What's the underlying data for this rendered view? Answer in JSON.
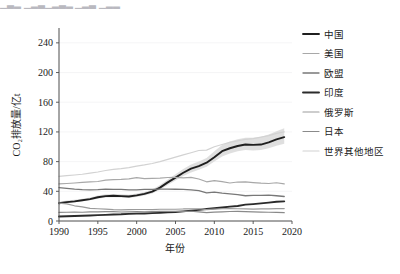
{
  "top_partial_text": "▁▃▂ ▁▂▃▁▂▃▂  ▁▂▃ ▁▂▂",
  "axes": {
    "x_label": "年份",
    "y_label": "CO₂排放量/亿t",
    "x_ticks": [
      "1990",
      "1995",
      "2000",
      "2005",
      "2010",
      "2015",
      "2020"
    ],
    "y_ticks": [
      "0",
      "40",
      "80",
      "120",
      "160",
      "200",
      "240"
    ]
  },
  "legend": {
    "items": [
      {
        "label": "中国",
        "color": "#1f1f1f",
        "width": 1.9
      },
      {
        "label": "美国",
        "color": "#a8a8a8",
        "width": 1.2
      },
      {
        "label": "欧盟",
        "color": "#787878",
        "width": 1.3
      },
      {
        "label": "印度",
        "color": "#2b2b2b",
        "width": 1.9
      },
      {
        "label": "俄罗斯",
        "color": "#9b9b9b",
        "width": 1.2
      },
      {
        "label": "日本",
        "color": "#8a8a8a",
        "width": 1.2
      },
      {
        "label": "世界其他地区",
        "color": "#d2d2d2",
        "width": 1.2
      }
    ]
  },
  "chart_data": {
    "type": "line",
    "title": "",
    "xlabel": "年份",
    "ylabel": "CO₂排放量/亿t",
    "xlim": [
      1990,
      2020
    ],
    "ylim": [
      0,
      260
    ],
    "grid": true,
    "legend_position": "right",
    "x": [
      1990,
      1991,
      1992,
      1993,
      1994,
      1995,
      1996,
      1997,
      1998,
      1999,
      2000,
      2001,
      2002,
      2003,
      2004,
      2005,
      2006,
      2007,
      2008,
      2009,
      2010,
      2011,
      2012,
      2013,
      2014,
      2015,
      2016,
      2017,
      2018,
      2019
    ],
    "series": [
      {
        "name": "中国",
        "color": "#1f1f1f",
        "values": [
          24.0,
          25.5,
          26.5,
          28.0,
          29.5,
          32.0,
          33.5,
          34.0,
          33.5,
          33.0,
          34.5,
          36.5,
          39.5,
          45.0,
          52.0,
          58.5,
          65.0,
          70.5,
          74.0,
          78.5,
          86.0,
          94.0,
          98.0,
          101.0,
          103.0,
          102.5,
          103.0,
          106.0,
          110.0,
          113.0
        ],
        "band_low": [
          22.5,
          24.0,
          25.0,
          26.5,
          28.0,
          30.0,
          31.5,
          32.0,
          31.5,
          31.0,
          32.5,
          34.5,
          37.0,
          42.0,
          48.5,
          54.5,
          60.5,
          65.5,
          69.0,
          73.0,
          80.0,
          87.0,
          91.0,
          94.0,
          95.5,
          95.0,
          95.5,
          98.0,
          101.5,
          104.0
        ],
        "band_high": [
          26.0,
          27.5,
          28.5,
          30.0,
          31.5,
          34.5,
          36.0,
          36.5,
          36.0,
          35.5,
          37.0,
          39.0,
          42.5,
          48.5,
          56.0,
          63.0,
          70.0,
          76.0,
          80.0,
          85.0,
          94.0,
          102.5,
          107.0,
          110.0,
          112.0,
          112.0,
          113.0,
          116.5,
          121.0,
          125.0
        ]
      },
      {
        "name": "美国",
        "color": "#a8a8a8",
        "values": [
          50.0,
          50.5,
          51.2,
          52.0,
          52.7,
          53.2,
          55.0,
          55.8,
          56.0,
          56.7,
          58.5,
          57.2,
          57.5,
          57.8,
          58.6,
          58.8,
          58.0,
          58.8,
          56.6,
          52.8,
          54.5,
          53.0,
          51.2,
          52.5,
          52.8,
          51.8,
          51.0,
          50.5,
          51.5,
          50.0
        ],
        "band_low": null,
        "band_high": null
      },
      {
        "name": "欧盟",
        "color": "#787878",
        "values": [
          45.0,
          44.0,
          43.0,
          42.3,
          42.0,
          42.3,
          43.0,
          42.5,
          42.5,
          41.8,
          42.0,
          42.5,
          42.5,
          43.0,
          43.0,
          42.8,
          42.5,
          42.0,
          41.0,
          37.8,
          38.8,
          37.5,
          36.5,
          35.5,
          34.0,
          34.5,
          34.5,
          34.8,
          34.0,
          33.0
        ],
        "band_low": null,
        "band_high": null
      },
      {
        "name": "印度",
        "color": "#2b2b2b",
        "values": [
          6.0,
          6.4,
          6.8,
          7.0,
          7.4,
          7.9,
          8.3,
          8.7,
          9.0,
          9.6,
          10.0,
          10.2,
          10.6,
          11.0,
          11.6,
          12.2,
          13.0,
          14.0,
          15.0,
          16.2,
          17.2,
          18.2,
          19.4,
          20.2,
          22.0,
          22.8,
          23.8,
          24.8,
          26.0,
          26.5
        ],
        "band_low": null,
        "band_high": null
      },
      {
        "name": "俄罗斯",
        "color": "#9b9b9b",
        "values": [
          24.0,
          23.0,
          20.5,
          19.0,
          17.0,
          16.5,
          16.0,
          15.2,
          15.0,
          15.3,
          15.5,
          15.5,
          15.4,
          15.8,
          15.8,
          15.8,
          16.2,
          16.2,
          16.5,
          15.3,
          16.0,
          16.5,
          16.8,
          16.5,
          16.2,
          16.0,
          16.2,
          16.4,
          16.8,
          16.8
        ],
        "band_low": null,
        "band_high": null
      },
      {
        "name": "日本",
        "color": "#8a8a8a",
        "values": [
          11.5,
          11.8,
          11.9,
          11.8,
          12.3,
          12.4,
          12.5,
          12.5,
          12.1,
          12.4,
          12.6,
          12.4,
          12.8,
          13.0,
          12.9,
          12.9,
          12.8,
          13.1,
          12.4,
          11.4,
          12.0,
          12.4,
          12.8,
          13.0,
          12.6,
          12.2,
          12.0,
          11.8,
          11.5,
          11.2
        ],
        "band_low": null,
        "band_high": null
      },
      {
        "name": "世界其他地区",
        "color": "#d2d2d2",
        "values": [
          60.0,
          61.0,
          62.0,
          63.0,
          64.5,
          66.0,
          68.0,
          69.5,
          70.5,
          72.0,
          74.0,
          75.5,
          77.5,
          80.0,
          83.0,
          86.0,
          89.0,
          92.0,
          95.0,
          95.5,
          100.0,
          103.0,
          106.0,
          108.0,
          110.0,
          111.0,
          113.0,
          115.0,
          118.0,
          120.0
        ],
        "band_low": null,
        "band_high": null
      }
    ]
  }
}
